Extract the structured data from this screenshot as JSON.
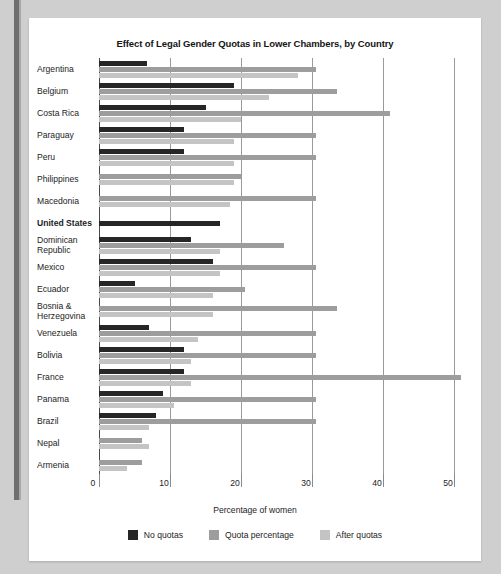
{
  "chart_data": {
    "type": "bar",
    "orientation": "horizontal",
    "title": "Effect of Legal Gender Quotas in Lower Chambers, by Country",
    "xlabel": "Percentage of women",
    "ylabel": "",
    "xlim": [
      0,
      50
    ],
    "xticks": [
      0,
      10,
      20,
      30,
      40,
      50
    ],
    "grid": true,
    "legend_position": "bottom",
    "categories": [
      "Argentina",
      "Belgium",
      "Costa Rica",
      "Paraguay",
      "Peru",
      "Philippines",
      "Macedonia",
      "United States",
      "Dominican\nRepublic",
      "Mexico",
      "Ecuador",
      "Bosnia &\nHerzegovina",
      "Venezuela",
      "Bolivia",
      "France",
      "Panama",
      "Brazil",
      "Nepal",
      "Armenia"
    ],
    "highlighted_category": "United States",
    "series": [
      {
        "name": "No quotas",
        "color": "#262626",
        "values": [
          6.7,
          19.0,
          15.0,
          12.0,
          12.0,
          null,
          null,
          17.0,
          13.0,
          16.0,
          5.0,
          null,
          7.0,
          12.0,
          12.0,
          9.0,
          8.0,
          null,
          null
        ]
      },
      {
        "name": "Quota percentage",
        "color": "#9d9d9d",
        "values": [
          30.5,
          33.5,
          41.0,
          30.5,
          30.5,
          20.0,
          30.5,
          null,
          26.0,
          30.5,
          20.5,
          33.5,
          30.5,
          30.5,
          51.0,
          30.5,
          30.5,
          6.0,
          6.0
        ]
      },
      {
        "name": "After quotas",
        "color": "#c4c4c4",
        "values": [
          28.0,
          24.0,
          20.0,
          19.0,
          19.0,
          19.0,
          18.5,
          null,
          17.0,
          17.0,
          16.0,
          16.0,
          14.0,
          13.0,
          13.0,
          10.5,
          7.0,
          7.0,
          4.0
        ]
      }
    ]
  },
  "legend": [
    {
      "label": "No quotas",
      "color": "#262626",
      "swatch_name": "legend-swatch-no-quotas"
    },
    {
      "label": "Quota percentage",
      "color": "#9d9d9d",
      "swatch_name": "legend-swatch-quota-percentage"
    },
    {
      "label": "After quotas",
      "color": "#c4c4c4",
      "swatch_name": "legend-swatch-after-quotas"
    }
  ],
  "theme": {
    "page_background": "#cfcfcf",
    "card_background": "#ffffff",
    "text_color": "#1d1d1d",
    "gridline_color": "#9a9a9a",
    "axis_color": "#4a4a4a"
  }
}
